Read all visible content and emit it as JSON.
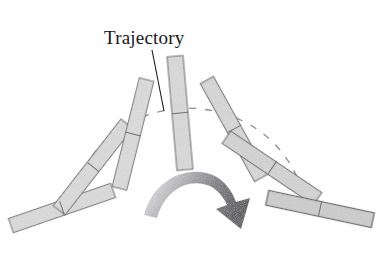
{
  "figure": {
    "title_label": "Trajectory",
    "background_color": "#fefefe",
    "annotation": {
      "label": "Trajectory",
      "label_x": 104,
      "label_y": 44,
      "leader_line": {
        "x1": 152,
        "y1": 50,
        "x2": 164,
        "y2": 111
      },
      "leader_color": "#1c1c20"
    },
    "arc": {
      "name": "trajectory-arc",
      "style": "dashed",
      "color": "#8e8e93",
      "dash_pattern": "7 9",
      "stroke_width": 1.3,
      "center_x": 188,
      "center_y": 212,
      "radius_x": 119,
      "radius_y": 104,
      "start_angle_deg": 197,
      "end_angle_deg": 343
    },
    "arrow": {
      "name": "rotation-arrow",
      "direction": "clockwise",
      "tail_color": "#e6e6e8",
      "head_color": "#4a4a50",
      "tip_x": 241,
      "tip_y": 229
    },
    "bars": [
      {
        "id": "bar-1",
        "position": "far-left",
        "cx": 62,
        "cy": 208,
        "angle_deg": -19,
        "length": 108,
        "width": 15,
        "fill": "#dedede",
        "stroke": "#6f6f74"
      },
      {
        "id": "bar-2",
        "position": "left",
        "cx": 93,
        "cy": 167,
        "angle_deg": -52,
        "length": 110,
        "width": 15,
        "fill": "#dedede",
        "stroke": "#6f6f74"
      },
      {
        "id": "bar-3",
        "position": "left-upper",
        "cx": 133,
        "cy": 134,
        "angle_deg": -76,
        "length": 112,
        "width": 15,
        "fill": "#dedede",
        "stroke": "#6f6f74"
      },
      {
        "id": "bar-4",
        "position": "top-center",
        "cx": 180,
        "cy": 113,
        "angle_deg": -95,
        "length": 114,
        "width": 16,
        "fill": "#dcdcdc",
        "stroke": "#6a6a70"
      },
      {
        "id": "bar-5",
        "position": "right-upper",
        "cx": 234,
        "cy": 129,
        "angle_deg": -119,
        "length": 112,
        "width": 15,
        "fill": "#dadada",
        "stroke": "#6a6a70"
      },
      {
        "id": "bar-6",
        "position": "right",
        "cx": 272,
        "cy": 168,
        "angle_deg": -146,
        "length": 110,
        "width": 15,
        "fill": "#d6d6d6",
        "stroke": "#65656a"
      },
      {
        "id": "bar-7",
        "position": "far-right",
        "cx": 320,
        "cy": 209,
        "angle_deg": -168,
        "length": 108,
        "width": 15,
        "fill": "#cfcfcf",
        "stroke": "#4f4f55"
      }
    ],
    "bar_ticks": [
      {
        "id": "tick-1",
        "cx": 62,
        "cy": 208,
        "angle_deg": -19
      },
      {
        "id": "tick-2",
        "cx": 93,
        "cy": 167,
        "angle_deg": -52
      },
      {
        "id": "tick-3",
        "cx": 133,
        "cy": 134,
        "angle_deg": -76
      },
      {
        "id": "tick-4",
        "cx": 180,
        "cy": 113,
        "angle_deg": -95
      },
      {
        "id": "tick-5",
        "cx": 234,
        "cy": 129,
        "angle_deg": -119
      },
      {
        "id": "tick-6",
        "cx": 272,
        "cy": 168,
        "angle_deg": -146
      },
      {
        "id": "tick-7",
        "cx": 320,
        "cy": 209,
        "angle_deg": -168
      }
    ]
  }
}
